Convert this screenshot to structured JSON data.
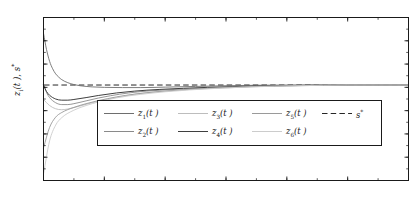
{
  "chart_data": {
    "type": "line",
    "title": "",
    "xlabel": "t",
    "ylabel": "z_i(t), s*",
    "xlim": [
      0,
      6
    ],
    "ylim": [
      -4,
      3
    ],
    "xticks": [
      0,
      1,
      2,
      3,
      4,
      5,
      6
    ],
    "xtick_labels": [
      "0",
      "1",
      "2",
      "3",
      "4",
      "5",
      "6"
    ],
    "yticks": [
      3,
      2,
      1,
      0,
      -1,
      -2,
      -3,
      -4
    ],
    "ytick_labels": [
      "3",
      "2",
      "1",
      "0",
      "-1",
      "-2",
      "-3",
      "-4"
    ],
    "grid": false,
    "legend_position": "lower-center-inside",
    "reference_line": {
      "name": "s*",
      "value": 0.1,
      "style": "dashed",
      "color": "#1a1a1a"
    },
    "steady_state_value": 0.1,
    "series": [
      {
        "name": "z1(t)",
        "label_base": "z",
        "label_sub": "1",
        "label_arg": "(t )",
        "color": "#6e6e6e",
        "width": 0.9,
        "style": "solid",
        "x": [
          0,
          0.05,
          0.1,
          0.15,
          0.2,
          0.25,
          0.3,
          0.4,
          0.5,
          0.6,
          0.8,
          1.0,
          1.3,
          1.6,
          2.0,
          2.5,
          3.0,
          3.5,
          4.0,
          5.0,
          6.0
        ],
        "y": [
          2.32,
          1.62,
          1.12,
          0.8,
          0.58,
          0.44,
          0.33,
          0.2,
          0.12,
          0.07,
          0.02,
          0.0,
          -0.01,
          -0.01,
          0.01,
          0.04,
          0.07,
          0.09,
          0.1,
          0.1,
          0.1
        ]
      },
      {
        "name": "z2(t)",
        "label_base": "z",
        "label_sub": "2",
        "label_arg": "(t )",
        "color": "#8a8a8a",
        "width": 0.9,
        "style": "solid",
        "x": [
          0,
          0.05,
          0.1,
          0.2,
          0.3,
          0.4,
          0.5,
          0.7,
          0.9,
          1.1,
          1.4,
          1.7,
          2.0,
          2.4,
          2.8,
          3.2,
          3.6,
          4.0,
          5.0,
          6.0
        ],
        "y": [
          0.12,
          -0.22,
          -0.44,
          -0.66,
          -0.74,
          -0.74,
          -0.7,
          -0.58,
          -0.46,
          -0.36,
          -0.24,
          -0.16,
          -0.11,
          -0.06,
          -0.02,
          0.02,
          0.05,
          0.07,
          0.1,
          0.1
        ]
      },
      {
        "name": "z3(t)",
        "label_base": "z",
        "label_sub": "3",
        "label_arg": "(t )",
        "color": "#bdbdbd",
        "width": 0.9,
        "style": "solid",
        "x": [
          0,
          0.1,
          0.2,
          0.3,
          0.4,
          0.6,
          0.8,
          1.0,
          1.3,
          1.6,
          2.0,
          2.4,
          2.8,
          3.2,
          3.6,
          4.0,
          5.0,
          6.0
        ],
        "y": [
          -0.52,
          -0.78,
          -0.92,
          -0.96,
          -0.93,
          -0.8,
          -0.66,
          -0.54,
          -0.38,
          -0.26,
          -0.16,
          -0.09,
          -0.04,
          0.0,
          0.04,
          0.06,
          0.1,
          0.1
        ]
      },
      {
        "name": "z4(t)",
        "label_base": "z",
        "label_sub": "4",
        "label_arg": "(t )",
        "color": "#3f3f3f",
        "width": 1.0,
        "style": "solid",
        "x": [
          0,
          0.05,
          0.1,
          0.2,
          0.3,
          0.4,
          0.5,
          0.7,
          0.9,
          1.2,
          1.5,
          1.9,
          2.3,
          2.7,
          3.1,
          3.5,
          4.0,
          5.0,
          6.0
        ],
        "y": [
          0.1,
          -0.18,
          -0.34,
          -0.5,
          -0.55,
          -0.55,
          -0.52,
          -0.44,
          -0.35,
          -0.24,
          -0.16,
          -0.09,
          -0.04,
          0.0,
          0.03,
          0.06,
          0.08,
          0.1,
          0.1
        ]
      },
      {
        "name": "z5(t)",
        "label_base": "z",
        "label_sub": "5",
        "label_arg": "(t )",
        "color": "#9a9a9a",
        "width": 0.9,
        "style": "solid",
        "x": [
          0,
          0.1,
          0.2,
          0.3,
          0.5,
          0.7,
          0.9,
          1.2,
          1.5,
          1.9,
          2.3,
          2.7,
          3.1,
          3.6,
          4.0,
          5.0,
          6.0
        ],
        "y": [
          -2.6,
          -1.72,
          -1.28,
          -1.08,
          -0.86,
          -0.7,
          -0.57,
          -0.41,
          -0.29,
          -0.18,
          -0.1,
          -0.04,
          0.01,
          0.05,
          0.07,
          0.1,
          0.1
        ]
      },
      {
        "name": "z6(t)",
        "label_base": "z",
        "label_sub": "6",
        "label_arg": "(t )",
        "color": "#cccccc",
        "width": 0.9,
        "style": "solid",
        "x": [
          0,
          0.1,
          0.2,
          0.3,
          0.5,
          0.7,
          0.9,
          1.2,
          1.6,
          2.0,
          2.4,
          2.8,
          3.3,
          3.8,
          4.2,
          5.0,
          6.0
        ],
        "y": [
          -3.72,
          -2.3,
          -1.62,
          -1.3,
          -0.98,
          -0.78,
          -0.63,
          -0.45,
          -0.3,
          -0.19,
          -0.11,
          -0.05,
          0.01,
          0.05,
          0.07,
          0.1,
          0.1
        ]
      }
    ]
  },
  "legend": {
    "row1": [
      {
        "label": "z1(t )",
        "base": "z",
        "sub": "1",
        "arg": "(t )",
        "color": "#6e6e6e",
        "style": "solid"
      },
      {
        "label": "z3(t )",
        "base": "z",
        "sub": "3",
        "arg": "(t )",
        "color": "#bdbdbd",
        "style": "solid"
      },
      {
        "label": "z5(t )",
        "base": "z",
        "sub": "5",
        "arg": "(t )",
        "color": "#9a9a9a",
        "style": "solid"
      },
      {
        "label": "s*",
        "base": "s",
        "sub": "",
        "arg": "*",
        "color": "#1a1a1a",
        "style": "dashed"
      }
    ],
    "row2": [
      {
        "label": "z2(t )",
        "base": "z",
        "sub": "2",
        "arg": "(t )",
        "color": "#8a8a8a",
        "style": "solid"
      },
      {
        "label": "z4(t )",
        "base": "z",
        "sub": "4",
        "arg": "(t )",
        "color": "#3f3f3f",
        "style": "solid"
      },
      {
        "label": "z6(t )",
        "base": "z",
        "sub": "6",
        "arg": "(t )",
        "color": "#cccccc",
        "style": "solid"
      }
    ]
  },
  "axes": {
    "frame_color": "#1a1a1a",
    "background": "#ffffff"
  }
}
